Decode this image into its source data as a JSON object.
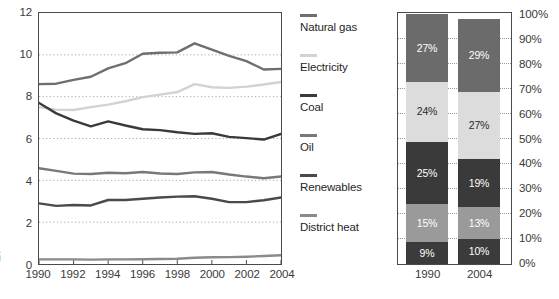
{
  "chart_data": [
    {
      "type": "line",
      "title": "",
      "xlabel": "",
      "ylabel": "EJ",
      "x": [
        1990,
        1991,
        1992,
        1993,
        1994,
        1995,
        1996,
        1997,
        1998,
        1999,
        2000,
        2001,
        2002,
        2003,
        2004
      ],
      "xlim": [
        1990,
        2004
      ],
      "ylim": [
        0,
        12
      ],
      "yticks": [
        "0",
        "2",
        "4",
        "6",
        "8",
        "10",
        "12"
      ],
      "ytick_values": [
        0,
        2,
        4,
        6,
        8,
        10,
        12
      ],
      "xticks": [
        "1990",
        "1992",
        "1994",
        "1996",
        "1998",
        "2000",
        "2002",
        "2004"
      ],
      "xtick_values": [
        1990,
        1992,
        1994,
        1996,
        1998,
        2000,
        2002,
        2004
      ],
      "grid": "horizontal-dotted",
      "legend_position": "right",
      "series": [
        {
          "name": "Natural gas",
          "color": "#6e6e6e",
          "values": [
            8.6,
            8.62,
            8.8,
            8.95,
            9.35,
            9.6,
            10.05,
            10.1,
            10.12,
            10.55,
            10.25,
            9.95,
            9.7,
            9.3,
            9.33
          ]
        },
        {
          "name": "Electricity",
          "color": "#d2d2d2",
          "values": [
            7.5,
            7.38,
            7.36,
            7.5,
            7.62,
            7.78,
            7.98,
            8.1,
            8.22,
            8.6,
            8.45,
            8.42,
            8.48,
            8.58,
            8.7
          ]
        },
        {
          "name": "Coal",
          "color": "#3a3a3a",
          "values": [
            7.7,
            7.2,
            6.85,
            6.58,
            6.82,
            6.62,
            6.44,
            6.4,
            6.3,
            6.22,
            6.25,
            6.08,
            6.02,
            5.95,
            6.22
          ]
        },
        {
          "name": "Oil",
          "color": "#787878",
          "values": [
            4.58,
            4.45,
            4.32,
            4.3,
            4.36,
            4.34,
            4.4,
            4.33,
            4.3,
            4.38,
            4.4,
            4.28,
            4.18,
            4.1,
            4.18
          ]
        },
        {
          "name": "Renewables",
          "color": "#4a4a4a",
          "values": [
            2.9,
            2.78,
            2.82,
            2.8,
            3.06,
            3.06,
            3.12,
            3.18,
            3.22,
            3.24,
            3.12,
            2.96,
            2.96,
            3.05,
            3.18
          ]
        },
        {
          "name": "District heat",
          "color": "#8a8a8a",
          "values": [
            0.22,
            0.22,
            0.22,
            0.21,
            0.22,
            0.22,
            0.23,
            0.24,
            0.25,
            0.3,
            0.32,
            0.33,
            0.35,
            0.38,
            0.42
          ]
        }
      ]
    },
    {
      "type": "bar",
      "stacked": true,
      "title": "",
      "xlabel": "",
      "ylabel": "",
      "categories": [
        "1990",
        "2004"
      ],
      "ylim": [
        0,
        100
      ],
      "yticks": [
        "0%",
        "10%",
        "20%",
        "30%",
        "40%",
        "50%",
        "60%",
        "70%",
        "80%",
        "90%",
        "100%"
      ],
      "ytick_values": [
        0,
        10,
        20,
        30,
        40,
        50,
        60,
        70,
        80,
        90,
        100
      ],
      "grid": "horizontal-dotted",
      "series": [
        {
          "name": "District heat",
          "color": "#3b3b3b",
          "label_color": "#ffffff",
          "values": [
            9,
            10
          ],
          "labels": [
            "9%",
            "10%"
          ]
        },
        {
          "name": "Renewables",
          "color": "#9a9a9a",
          "label_color": "#ffffff",
          "values": [
            15,
            13
          ],
          "labels": [
            "15%",
            "13%"
          ]
        },
        {
          "name": "Oil",
          "color": "#3a3a3a",
          "label_color": "#ffffff",
          "values": [
            25,
            19
          ],
          "labels": [
            "25%",
            "19%"
          ]
        },
        {
          "name": "Electricity",
          "color": "#dcdcdc",
          "label_color": "#2a2a2a",
          "values": [
            24,
            27
          ],
          "labels": [
            "24%",
            "27%"
          ]
        },
        {
          "name": "Natural gas",
          "color": "#6b6b6b",
          "label_color": "#ffffff",
          "values": [
            27,
            29
          ],
          "labels": [
            "27%",
            "29%"
          ]
        }
      ]
    }
  ],
  "line_chart": {
    "y_axis_unit": "EJ",
    "y_ticks": [
      "12",
      "10",
      "8",
      "6",
      "4",
      "2",
      "0"
    ],
    "x_ticks": [
      "1990",
      "1992",
      "1994",
      "1996",
      "1998",
      "2000",
      "2002",
      "2004"
    ]
  },
  "legend": {
    "items": [
      {
        "label": "Natural gas",
        "color": "#6e6e6e"
      },
      {
        "label": "Electricity",
        "color": "#d2d2d2"
      },
      {
        "label": "Coal",
        "color": "#3a3a3a"
      },
      {
        "label": "Oil",
        "color": "#787878"
      },
      {
        "label": "Renewables",
        "color": "#4a4a4a"
      },
      {
        "label": "District heat",
        "color": "#8a8a8a"
      }
    ]
  },
  "bar_chart": {
    "y_ticks": [
      "100%",
      "90%",
      "80%",
      "70%",
      "60%",
      "50%",
      "40%",
      "30%",
      "20%",
      "10%",
      "0%"
    ],
    "x_ticks": [
      "1990",
      "2004"
    ],
    "bars": [
      {
        "category": "1990",
        "segments": [
          {
            "name": "Natural gas",
            "label": "27%",
            "value": 27,
            "color": "#6b6b6b",
            "text_color": "#ffffff"
          },
          {
            "name": "Electricity",
            "label": "24%",
            "value": 24,
            "color": "#dcdcdc",
            "text_color": "#2a2a2a"
          },
          {
            "name": "Oil",
            "label": "25%",
            "value": 25,
            "color": "#3a3a3a",
            "text_color": "#ffffff"
          },
          {
            "name": "Renewables",
            "label": "15%",
            "value": 15,
            "color": "#9a9a9a",
            "text_color": "#ffffff"
          },
          {
            "name": "District heat",
            "label": "9%",
            "value": 9,
            "color": "#3b3b3b",
            "text_color": "#ffffff"
          }
        ]
      },
      {
        "category": "2004",
        "segments": [
          {
            "name": "Natural gas",
            "label": "29%",
            "value": 29,
            "color": "#6b6b6b",
            "text_color": "#ffffff"
          },
          {
            "name": "Electricity",
            "label": "27%",
            "value": 27,
            "color": "#dcdcdc",
            "text_color": "#2a2a2a"
          },
          {
            "name": "Oil",
            "label": "19%",
            "value": 19,
            "color": "#3a3a3a",
            "text_color": "#ffffff"
          },
          {
            "name": "Renewables",
            "label": "13%",
            "value": 13,
            "color": "#9a9a9a",
            "text_color": "#ffffff"
          },
          {
            "name": "District heat",
            "label": "10%",
            "value": 10,
            "color": "#3b3b3b",
            "text_color": "#ffffff"
          }
        ]
      }
    ]
  }
}
